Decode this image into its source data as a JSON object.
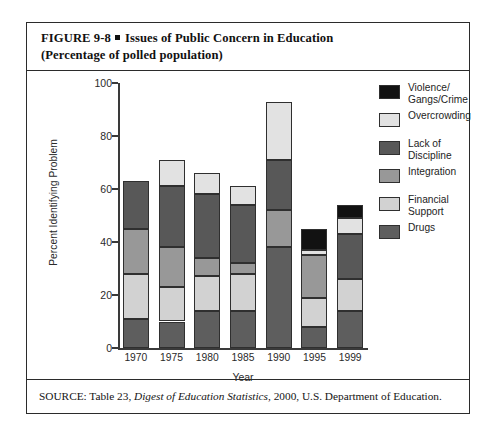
{
  "figure": {
    "title_line1_prefix": "FIGURE  9-8",
    "title_line1": "Issues of Public Concern in Education",
    "title_line2": "(Percentage of polled population)",
    "source_prefix": "SOURCE: Table 23, ",
    "source_italic": "Digest of Education Statistics",
    "source_suffix": ", 2000, U.S. Department of Education."
  },
  "chart_data": {
    "type": "bar",
    "subtype": "stacked-bar",
    "title": "Issues of Public Concern in Education",
    "xlabel": "Year",
    "ylabel": "Percent Identifying Problem",
    "ylim": [
      0,
      100
    ],
    "yticks": [
      0,
      20,
      40,
      60,
      80,
      100
    ],
    "grid": false,
    "legend_position": "right",
    "categories": [
      "1970",
      "1975",
      "1980",
      "1985",
      "1990",
      "1995",
      "1999"
    ],
    "stack_order_bottom_to_top": [
      "Drugs",
      "Financial Support",
      "Integration",
      "Lack of Discipline",
      "Overcrowding",
      "Violence/Gangs/Crime"
    ],
    "series": [
      {
        "name": "Drugs",
        "color": "#5e5e5e",
        "values": [
          11,
          10,
          14,
          14,
          38,
          8,
          14
        ]
      },
      {
        "name": "Financial Support",
        "color": "#d2d2d2",
        "values": [
          17,
          13,
          13,
          14,
          0,
          11,
          12
        ]
      },
      {
        "name": "Integration",
        "color": "#989898",
        "values": [
          17,
          15,
          7,
          4,
          14,
          16,
          0
        ]
      },
      {
        "name": "Lack of Discipline",
        "color": "#585858",
        "values": [
          18,
          23,
          24,
          22,
          19,
          0,
          17
        ]
      },
      {
        "name": "Overcrowding",
        "color": "#e2e2e2",
        "values": [
          0,
          10,
          8,
          7,
          22,
          2,
          6
        ]
      },
      {
        "name": "Violence/Gangs/Crime",
        "color": "#121212",
        "values": [
          0,
          0,
          0,
          0,
          0,
          8,
          5
        ]
      }
    ],
    "totals": [
      63,
      71,
      66,
      61,
      93,
      45,
      54
    ]
  },
  "legend": {
    "entries": [
      {
        "label": "Violence/\nGangs/Crime",
        "color": "#121212"
      },
      {
        "label": "Overcrowding",
        "color": "#e2e2e2"
      },
      {
        "label": "Lack of\nDiscipline",
        "color": "#585858"
      },
      {
        "label": "Integration",
        "color": "#989898"
      },
      {
        "label": "Financial\nSupport",
        "color": "#d2d2d2"
      },
      {
        "label": "Drugs",
        "color": "#5e5e5e"
      }
    ]
  }
}
